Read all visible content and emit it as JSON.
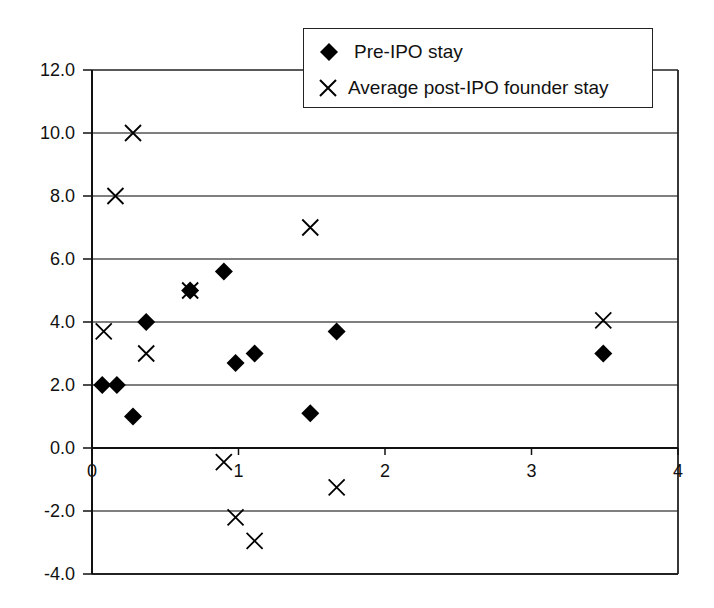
{
  "chart_data": {
    "type": "scatter",
    "title": "",
    "xlabel": "",
    "ylabel": "",
    "xlim": [
      0,
      4
    ],
    "ylim": [
      -4,
      12
    ],
    "x_ticks": [
      0,
      1,
      2,
      3,
      4
    ],
    "x_tick_labels": [
      "0",
      "1",
      "2",
      "3",
      "4"
    ],
    "y_ticks": [
      12,
      10,
      8,
      6,
      4,
      2,
      0,
      -2,
      -4
    ],
    "y_tick_labels": [
      "12.0",
      "10.0",
      "8.0",
      "6.0",
      "4.0",
      "2.0",
      "0.0",
      "-2.0",
      "-4.0"
    ],
    "grid": {
      "horizontal": true,
      "vertical": false
    },
    "legend_position": "top-right",
    "series": [
      {
        "name": "Pre-IPO stay",
        "marker": "diamond",
        "color": "#000000",
        "points": [
          {
            "x": 0.07,
            "y": 2.0
          },
          {
            "x": 0.17,
            "y": 2.0
          },
          {
            "x": 0.28,
            "y": 1.0
          },
          {
            "x": 0.37,
            "y": 4.0
          },
          {
            "x": 0.67,
            "y": 5.0
          },
          {
            "x": 0.9,
            "y": 5.6
          },
          {
            "x": 0.98,
            "y": 2.7
          },
          {
            "x": 1.11,
            "y": 3.0
          },
          {
            "x": 1.49,
            "y": 1.1
          },
          {
            "x": 1.67,
            "y": 3.7
          },
          {
            "x": 3.49,
            "y": 3.0
          }
        ]
      },
      {
        "name": "Average post-IPO founder stay",
        "marker": "x",
        "color": "#000000",
        "points": [
          {
            "x": 0.08,
            "y": 3.7
          },
          {
            "x": 0.16,
            "y": 8.0
          },
          {
            "x": 0.28,
            "y": 10.0
          },
          {
            "x": 0.37,
            "y": 3.0
          },
          {
            "x": 0.67,
            "y": 5.0
          },
          {
            "x": 0.9,
            "y": -0.45
          },
          {
            "x": 0.98,
            "y": -2.2
          },
          {
            "x": 1.11,
            "y": -2.95
          },
          {
            "x": 1.49,
            "y": 7.0
          },
          {
            "x": 1.67,
            "y": -1.25
          },
          {
            "x": 3.49,
            "y": 4.05
          }
        ]
      }
    ]
  },
  "legend": {
    "items": [
      {
        "label": "Pre-IPO stay",
        "icon": "diamond-marker-icon"
      },
      {
        "label": "Average post-IPO founder stay",
        "icon": "x-marker-icon"
      }
    ]
  }
}
